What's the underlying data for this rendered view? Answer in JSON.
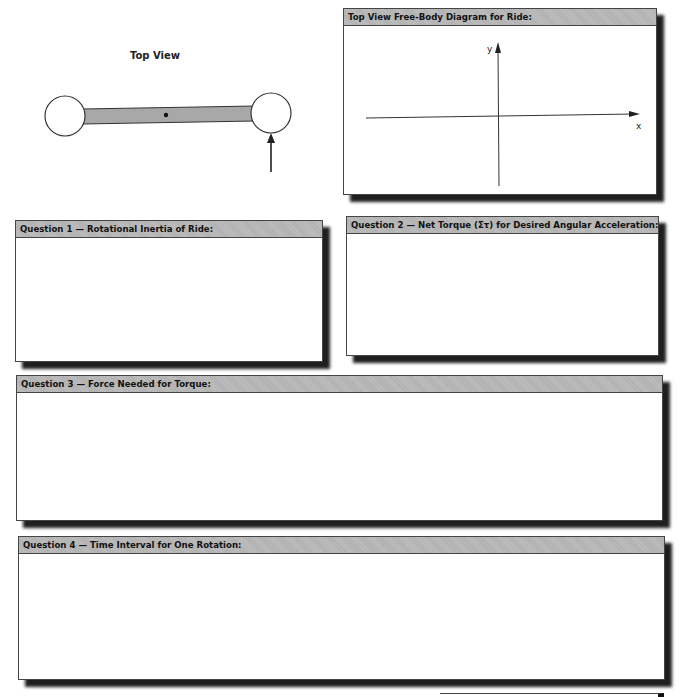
{
  "top_view": {
    "title": "Top View",
    "diagram": {
      "description": "Two circular seats connected by a shaded bar with a central pivot dot; an upward arrow points at the right circle",
      "icons": [
        "left-seat-circle",
        "connecting-bar",
        "pivot-dot",
        "right-seat-circle",
        "force-arrow-icon"
      ]
    }
  },
  "fbd_box": {
    "title": "Top View Free-Body Diagram for Ride:",
    "axes": {
      "x_label": "x",
      "y_label": "y"
    }
  },
  "questions": [
    {
      "label": "Question 1 — Rotational Inertia of Ride:"
    },
    {
      "label": "Question 2 — Net Torque (Στ) for Desired Angular Acceleration:"
    },
    {
      "label": "Question 3 — Force Needed for Torque:"
    },
    {
      "label": "Question 4 — Time Interval for One Rotation:"
    }
  ],
  "colors": {
    "header_gray": "#b9b9b9",
    "bar_gray": "#a8a8a8",
    "border": "#444444",
    "shadow": "#111111"
  }
}
